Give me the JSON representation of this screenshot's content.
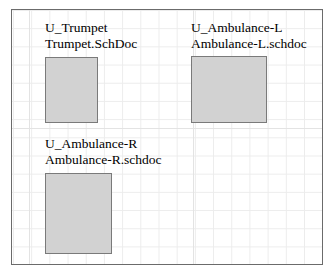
{
  "sheet": {
    "title": "Schematic sheet symbols",
    "background_color": "#ffffff",
    "border_color": "#6b6b6b",
    "grid_color": "#ececec"
  },
  "symbol_style": {
    "fill_color": "#d2d2d2",
    "border_color": "#7a7a7a",
    "text_color": "#000000"
  },
  "symbols": [
    {
      "designator": "U_Trumpet",
      "filename": "Trumpet.SchDoc"
    },
    {
      "designator": "U_Ambulance-L",
      "filename": "Ambulance-L.schdoc"
    },
    {
      "designator": "U_Ambulance-R",
      "filename": "Ambulance-R.schdoc"
    }
  ]
}
